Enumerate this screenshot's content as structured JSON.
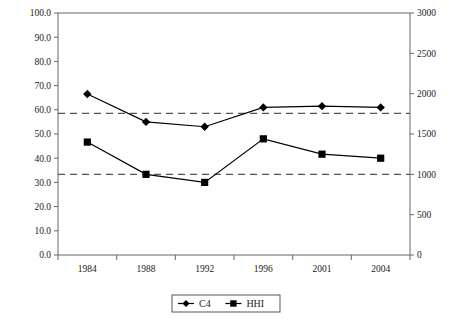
{
  "chart_data": {
    "type": "line",
    "title": "",
    "xlabel": "",
    "ylabel": "",
    "categories": [
      "1984",
      "1988",
      "1992",
      "1996",
      "2001",
      "2004"
    ],
    "grid": false,
    "legend_position": "bottom",
    "left_axis": {
      "label": "",
      "ylim": [
        0.0,
        100.0
      ],
      "tick_step": 10.0,
      "ticks": [
        "0.0",
        "10.0",
        "20.0",
        "30.0",
        "40.0",
        "50.0",
        "60.0",
        "70.0",
        "80.0",
        "90.0",
        "100.0"
      ]
    },
    "right_axis": {
      "label": "",
      "ylim": [
        0,
        3000
      ],
      "tick_step": 500,
      "ticks": [
        "0",
        "500",
        "1000",
        "1500",
        "2000",
        "2500",
        "3000"
      ]
    },
    "series": [
      {
        "name": "C4",
        "axis": "left",
        "marker": "diamond",
        "color": "#000000",
        "values": [
          66.5,
          55.0,
          53.0,
          61.0,
          61.5,
          61.0
        ]
      },
      {
        "name": "HHI",
        "axis": "right",
        "marker": "square",
        "color": "#000000",
        "values": [
          1400,
          1000,
          900,
          1440,
          1250,
          1200
        ],
        "left_equivalent": [
          47.0,
          33.0,
          30.0,
          48.0,
          41.5,
          40.0
        ]
      }
    ],
    "reference_lines": [
      {
        "name": "c4-threshold",
        "axis": "left",
        "value": 58.5,
        "style": "dashed"
      },
      {
        "name": "hhi-threshold",
        "axis": "right",
        "value": 1000,
        "style": "dashed"
      }
    ],
    "legend": [
      {
        "label": "C4",
        "marker": "diamond"
      },
      {
        "label": "HHI",
        "marker": "square"
      }
    ]
  }
}
